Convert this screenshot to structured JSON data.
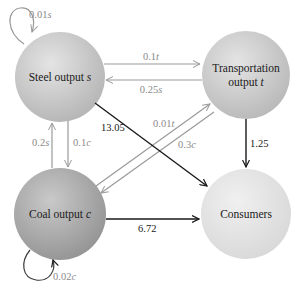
{
  "diagram": {
    "type": "flow-diagram",
    "nodes": [
      {
        "id": "steel",
        "label_line1": "Steel output ",
        "label_var": "s"
      },
      {
        "id": "transportation",
        "label_line1": "Transportation",
        "label_line2": "output ",
        "label_var": "t"
      },
      {
        "id": "coal",
        "label_line1": "Coal output ",
        "label_var": "c"
      },
      {
        "id": "consumers",
        "label_line1": "Consumers"
      }
    ],
    "edges": [
      {
        "from": "steel",
        "to": "steel",
        "coef": "0.01",
        "var": "s"
      },
      {
        "from": "transportation",
        "to": "steel",
        "coef": "0.1",
        "var": "t"
      },
      {
        "from": "steel",
        "to": "transportation",
        "coef": "0.25",
        "var": "s"
      },
      {
        "from": "coal",
        "to": "steel",
        "coef": "0.2",
        "var": "s"
      },
      {
        "from": "steel",
        "to": "coal",
        "coef": "0.1",
        "var": "c"
      },
      {
        "from": "transportation",
        "to": "coal",
        "coef": "0.01",
        "var": "t"
      },
      {
        "from": "coal",
        "to": "transportation",
        "coef": "0.3",
        "var": "c"
      },
      {
        "from": "steel",
        "to": "consumers",
        "value": "13.05"
      },
      {
        "from": "transportation",
        "to": "consumers",
        "value": "1.25"
      },
      {
        "from": "coal",
        "to": "consumers",
        "value": "6.72"
      },
      {
        "from": "coal",
        "to": "coal",
        "coef": "0.02",
        "var": "c"
      }
    ]
  },
  "labels": {
    "steel_self": {
      "coef": "0.01",
      "var": "s"
    },
    "steel_to_transport_top": {
      "coef": "0.1",
      "var": "t"
    },
    "transport_to_steel_bottom": {
      "coef": "0.25",
      "var": "s"
    },
    "coal_up": {
      "coef": "0.2",
      "var": "s"
    },
    "steel_down": {
      "coef": "0.1",
      "var": "c"
    },
    "diag_upper": {
      "coef": "0.01",
      "var": "t"
    },
    "diag_lower": {
      "coef": "0.3",
      "var": "c"
    },
    "steel_consumers": "13.05",
    "transport_consumers": "1.25",
    "coal_consumers": "6.72",
    "coal_self": {
      "coef": "0.02",
      "var": "c"
    }
  },
  "colors": {
    "gray_edge": "#9a9a9a",
    "dark_edge": "#1a1a1a",
    "node_dark": "#a9a9a9",
    "node_mid": "#c8c8c8",
    "node_light": "#e6e6e6"
  }
}
